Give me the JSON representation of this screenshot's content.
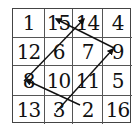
{
  "diagram": {
    "type": "magic-square-path",
    "grid": [
      [
        "1",
        "15",
        "14",
        "4"
      ],
      [
        "12",
        "6",
        "7",
        "9"
      ],
      [
        "8",
        "10",
        "11",
        "5"
      ],
      [
        "13",
        "3",
        "2",
        "16"
      ]
    ],
    "arrows": [
      {
        "from": "2",
        "to": "8"
      },
      {
        "from": "8",
        "to": "14"
      },
      {
        "from": "3",
        "to": "9"
      },
      {
        "from": "9",
        "to": "15"
      }
    ],
    "line_color": "#111111"
  }
}
